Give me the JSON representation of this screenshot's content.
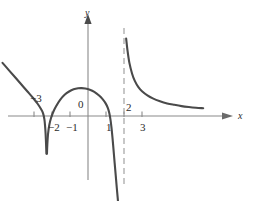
{
  "figure": {
    "background_color": "#ffffff",
    "curve_color": "#4a4a4a",
    "axis_color": "#8a8a8a",
    "asymptote_color": "#9a9a9a",
    "text_color": "#2b2b2b"
  },
  "chart_data": {
    "type": "line",
    "title": "",
    "subtitle": "",
    "xlabel": "x",
    "ylabel": "y",
    "xlim": [
      -4.8,
      6.6
    ],
    "ylim": [
      -4.8,
      5.0
    ],
    "grid": false,
    "legend": null,
    "origin_label": "0",
    "x_ticks": [
      -3,
      -2,
      -1,
      1,
      2,
      3
    ],
    "x_tick_labels": [
      "−3",
      "−2",
      "−1",
      "1",
      "2",
      "3"
    ],
    "y_ticks": [],
    "y_tick_labels": [],
    "annotations": [
      {
        "name": "vertical-asymptote",
        "type": "vline",
        "x": 2,
        "style": "dashed"
      },
      {
        "name": "x-axis-arrow",
        "type": "arrow",
        "direction": "right"
      },
      {
        "name": "y-axis-arrow",
        "type": "arrow",
        "direction": "up"
      }
    ],
    "features": [
      {
        "name": "cusp-root",
        "x": -2.35,
        "y": 0
      },
      {
        "name": "local-maximum",
        "x": -0.35,
        "y": 1.55
      },
      {
        "name": "root",
        "x": 1.2,
        "y": 0
      },
      {
        "name": "vertical-asymptote",
        "x": 2,
        "y": null
      },
      {
        "name": "horizontal-asymptote-right",
        "x": null,
        "y": 0.38
      }
    ],
    "series": [
      {
        "name": "branch-left",
        "points": [
          [
            -4.75,
            2.95
          ],
          [
            -4.4,
            2.55
          ],
          [
            -4.05,
            2.15
          ],
          [
            -3.7,
            1.75
          ],
          [
            -3.35,
            1.35
          ],
          [
            -3.05,
            1.0
          ],
          [
            -2.8,
            0.68
          ],
          [
            -2.62,
            0.4
          ],
          [
            -2.5,
            0.16
          ],
          [
            -2.42,
            -0.2
          ],
          [
            -2.37,
            -0.75
          ],
          [
            -2.34,
            -1.3
          ],
          [
            -2.32,
            -1.85
          ],
          [
            -2.31,
            -2.1
          ]
        ]
      },
      {
        "name": "branch-arch",
        "points": [
          [
            -2.28,
            -2.1
          ],
          [
            -2.26,
            -1.6
          ],
          [
            -2.22,
            -1.0
          ],
          [
            -2.15,
            -0.5
          ],
          [
            -2.05,
            -0.1
          ],
          [
            -1.92,
            0.25
          ],
          [
            -1.75,
            0.58
          ],
          [
            -1.55,
            0.9
          ],
          [
            -1.3,
            1.18
          ],
          [
            -1.05,
            1.36
          ],
          [
            -0.8,
            1.48
          ],
          [
            -0.55,
            1.54
          ],
          [
            -0.35,
            1.55
          ],
          [
            -0.15,
            1.53
          ],
          [
            0.1,
            1.46
          ],
          [
            0.35,
            1.34
          ],
          [
            0.6,
            1.15
          ],
          [
            0.8,
            0.95
          ],
          [
            0.98,
            0.7
          ],
          [
            1.1,
            0.45
          ],
          [
            1.18,
            0.18
          ],
          [
            1.24,
            -0.15
          ],
          [
            1.3,
            -0.6
          ],
          [
            1.36,
            -1.2
          ],
          [
            1.42,
            -1.9
          ],
          [
            1.48,
            -2.6
          ],
          [
            1.54,
            -3.3
          ],
          [
            1.6,
            -4.0
          ],
          [
            1.65,
            -4.55
          ],
          [
            1.68,
            -4.9
          ]
        ]
      },
      {
        "name": "branch-right",
        "points": [
          [
            2.12,
            4.3
          ],
          [
            2.2,
            3.6
          ],
          [
            2.3,
            2.95
          ],
          [
            2.45,
            2.35
          ],
          [
            2.6,
            1.95
          ],
          [
            2.8,
            1.6
          ],
          [
            3.0,
            1.38
          ],
          [
            3.3,
            1.15
          ],
          [
            3.6,
            0.98
          ],
          [
            4.0,
            0.82
          ],
          [
            4.4,
            0.7
          ],
          [
            4.8,
            0.62
          ],
          [
            5.2,
            0.55
          ],
          [
            5.6,
            0.5
          ],
          [
            6.0,
            0.46
          ],
          [
            6.4,
            0.43
          ]
        ]
      }
    ]
  }
}
